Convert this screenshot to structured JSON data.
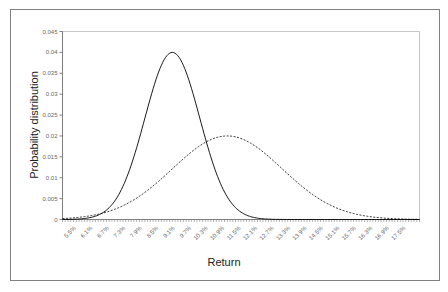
{
  "chart_data": {
    "type": "line",
    "title": "",
    "xlabel": "Return",
    "ylabel": "Probability distribution",
    "ylim": [
      0,
      0.045
    ],
    "xlim_percent": [
      5.0,
      18.0
    ],
    "y_ticks": [
      "0",
      "0.005",
      "0.01",
      "0.015",
      "0.02",
      "0.025",
      "0.03",
      "0.035",
      "0.04",
      "0.045"
    ],
    "y_tick_values": [
      0,
      0.005,
      0.01,
      0.015,
      0.02,
      0.025,
      0.03,
      0.035,
      0.04,
      0.045
    ],
    "x_tick_labels": [
      "5.5%",
      "6.1%",
      "6.7%",
      "7.3%",
      "7.9%",
      "8.5%",
      "9.1%",
      "9.7%",
      "10.3%",
      "10.9%",
      "11.5%",
      "12.1%",
      "12.7%",
      "13.3%",
      "13.9%",
      "14.5%",
      "15.1%",
      "15.7%",
      "16.3%",
      "16.9%",
      "17.5%"
    ],
    "x_tick_values": [
      5.5,
      6.1,
      6.7,
      7.3,
      7.9,
      8.5,
      9.1,
      9.7,
      10.3,
      10.9,
      11.5,
      12.1,
      12.7,
      13.3,
      13.9,
      14.5,
      15.1,
      15.7,
      16.3,
      16.9,
      17.5
    ],
    "minor_tick_step_percent": 0.1,
    "grid": false,
    "legend": "none",
    "series": [
      {
        "name": "Solid (mean 9%, sd 1%)",
        "style": "solid",
        "mean_percent": 9.0,
        "sd_percent": 1.0,
        "peak": 0.04,
        "color": "#000000"
      },
      {
        "name": "Dashed (mean 11%, sd 2%)",
        "style": "dashed",
        "mean_percent": 11.0,
        "sd_percent": 2.0,
        "peak": 0.02,
        "color": "#000000"
      }
    ],
    "sample_step_percent": 0.1
  },
  "colors": {
    "frame": "#808080",
    "plot_border": "#c0c0c0",
    "axis": "#808080",
    "line": "#000000"
  }
}
